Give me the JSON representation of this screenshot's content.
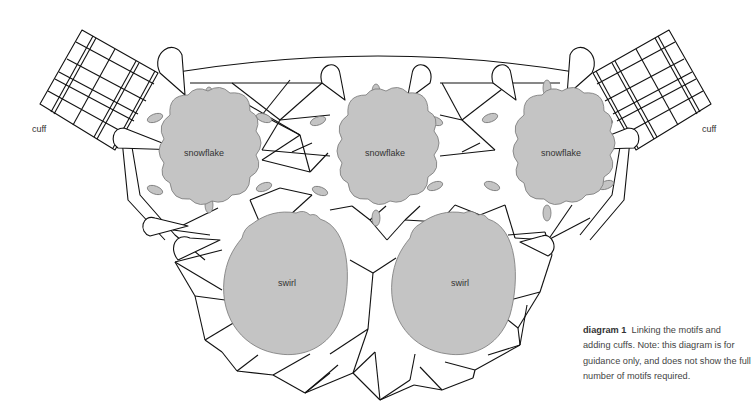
{
  "diagram": {
    "title": "diagram 1",
    "caption": "Linking the motifs and adding cuffs. Note: this diagram is for guidance only, and does not show the full number of motifs required.",
    "labels": {
      "cuff_left": "cuff",
      "cuff_right": "cuff"
    },
    "motifs": [
      {
        "type": "snowflake",
        "label": "snowflake",
        "cx": 204,
        "cy": 153
      },
      {
        "type": "snowflake",
        "label": "snowflake",
        "cx": 385,
        "cy": 153
      },
      {
        "type": "snowflake",
        "label": "snowflake",
        "cx": 561,
        "cy": 153
      },
      {
        "type": "swirl",
        "label": "swirl",
        "cx": 287,
        "cy": 283
      },
      {
        "type": "swirl",
        "label": "swirl",
        "cx": 460,
        "cy": 283
      }
    ],
    "colors": {
      "motif_fill": "#c4c4c4",
      "line": "#111111",
      "text": "#333333"
    }
  }
}
